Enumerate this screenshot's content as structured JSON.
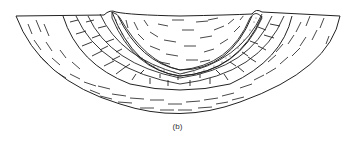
{
  "figure": {
    "caption": "(b)",
    "layers": [
      {
        "name": "outer-shale",
        "pattern": "dashes"
      },
      {
        "name": "limestone",
        "pattern": "bricks"
      },
      {
        "name": "sandstone",
        "pattern": "dots"
      },
      {
        "name": "inner-shale",
        "pattern": "dashes"
      }
    ],
    "colors": {
      "line": "#222222",
      "background": "#ffffff"
    }
  }
}
